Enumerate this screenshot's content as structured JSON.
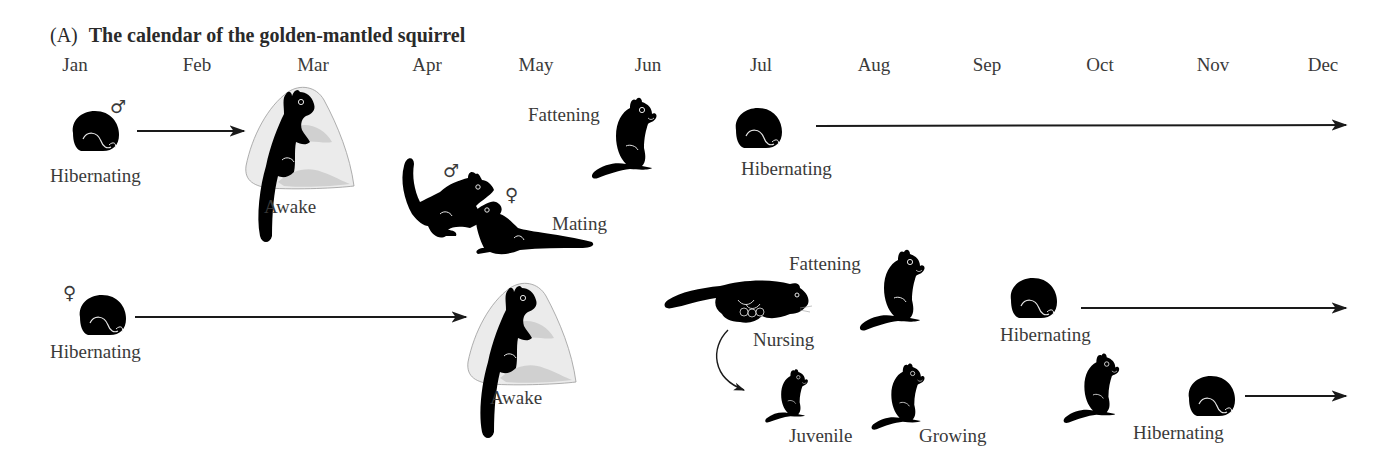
{
  "figure": {
    "panel_label": "(A)",
    "title": "The calendar of the golden-mantled squirrel"
  },
  "months": [
    "Jan",
    "Feb",
    "Mar",
    "Apr",
    "May",
    "Jun",
    "Jul",
    "Aug",
    "Sep",
    "Oct",
    "Nov",
    "Dec"
  ],
  "male_row": {
    "sex_symbol": "♂",
    "stages": [
      {
        "label": "Hibernating",
        "icon": "curled-squirrel-icon"
      },
      {
        "label": "Awake",
        "icon": "squirrel-on-rock-icon"
      },
      {
        "label": "Mating",
        "icon": "mating-pair-icon",
        "symbols": [
          "♂",
          "♀"
        ]
      },
      {
        "label": "Fattening",
        "icon": "sitting-squirrel-icon"
      },
      {
        "label": "Hibernating",
        "icon": "curled-squirrel-icon"
      }
    ]
  },
  "female_row": {
    "sex_symbol": "♀",
    "stages": [
      {
        "label": "Hibernating",
        "icon": "curled-squirrel-icon"
      },
      {
        "label": "Awake",
        "icon": "squirrel-on-rock-icon"
      },
      {
        "label": "Nursing",
        "icon": "nursing-squirrel-icon"
      },
      {
        "label": "Fattening",
        "icon": "sitting-squirrel-icon"
      },
      {
        "label": "Hibernating",
        "icon": "curled-squirrel-icon"
      }
    ]
  },
  "juvenile_row": {
    "stages": [
      {
        "label": "Juvenile",
        "icon": "small-sitting-squirrel-icon"
      },
      {
        "label": "Growing",
        "icon": "sitting-squirrel-icon"
      },
      {
        "label": "",
        "icon": "sitting-squirrel-icon"
      },
      {
        "label": "Hibernating",
        "icon": "curled-squirrel-icon"
      }
    ]
  },
  "colors": {
    "silhouette": "#000000",
    "text": "#3a3a3a",
    "rock": "#d9d9d9",
    "rock_shade": "#bdbdbd",
    "arrow": "#1a1a1a"
  }
}
